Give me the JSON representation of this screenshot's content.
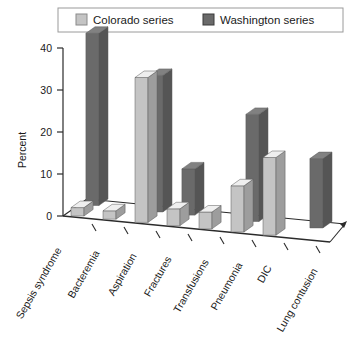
{
  "chart_data": {
    "type": "bar",
    "title": "",
    "subtitle": "",
    "xlabel": "",
    "ylabel": "Percent",
    "ylim": [
      0,
      40
    ],
    "yticks": [
      0,
      10,
      20,
      30,
      40
    ],
    "ytick_labels": [
      "0",
      "10",
      "20",
      "30",
      "40"
    ],
    "grid": false,
    "legend_position": "top",
    "three_d": true,
    "categories": [
      "Sepsis syndrome",
      "Bacteremia",
      "Aspiration",
      "Fractures",
      "Transfusions",
      "Pneumonia",
      "DIC",
      "Lung contusion"
    ],
    "series": [
      {
        "name": "Colorado series",
        "color": "#c4c4c4",
        "values": [
          2,
          2,
          34.5,
          4,
          4,
          11,
          18.5,
          0
        ]
      },
      {
        "name": "Washington series",
        "color": "#6a6a6a",
        "values": [
          41,
          0,
          32.5,
          11,
          0,
          25.5,
          0,
          16.5
        ]
      }
    ]
  },
  "legend": {
    "items": [
      {
        "label": "Colorado series",
        "swatch": "#c4c4c4"
      },
      {
        "label": "Washington series",
        "swatch": "#6a6a6a"
      }
    ]
  },
  "axis": {
    "y_title": "Percent",
    "y_tick_0": "0",
    "y_tick_1": "10",
    "y_tick_2": "20",
    "y_tick_3": "30",
    "y_tick_4": "40"
  },
  "categories": {
    "c0": "Sepsis syndrome",
    "c1": "Bacteremia",
    "c2": "Aspiration",
    "c3": "Fractures",
    "c4": "Transfusions",
    "c5": "Pneumonia",
    "c6": "DIC",
    "c7": "Lung contusion"
  },
  "colors": {
    "colorado": "#c4c4c4",
    "colorado_top": "#dcdcdc",
    "colorado_side": "#a8a8a8",
    "washington": "#6a6a6a",
    "washington_top": "#8a8a8a",
    "washington_side": "#4e4e4e",
    "axis": "#2b2b2b",
    "floor": "#ffffff",
    "legend_border": "#9a9a9a"
  }
}
